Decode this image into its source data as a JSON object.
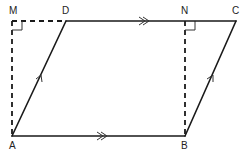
{
  "diagram": {
    "title": "",
    "points": {
      "M": "M",
      "D": "D",
      "N": "N",
      "C": "C",
      "A": "A",
      "B": "B"
    },
    "segments": [
      {
        "name": "AB",
        "style": "solid",
        "marker": "double-arrow"
      },
      {
        "name": "DC",
        "style": "solid",
        "marker": "double-arrow"
      },
      {
        "name": "AD",
        "style": "solid",
        "marker": "single-arrow"
      },
      {
        "name": "BC",
        "style": "solid",
        "marker": "single-arrow"
      },
      {
        "name": "MD",
        "style": "dashed",
        "marker": "none"
      },
      {
        "name": "AM",
        "style": "dashed",
        "marker": "none"
      },
      {
        "name": "BN",
        "style": "dashed",
        "marker": "none"
      }
    ],
    "right_angles": [
      "M",
      "N"
    ],
    "colors": {
      "line": "#1a1a1a",
      "label": "#222222",
      "background": "#ffffff"
    }
  }
}
